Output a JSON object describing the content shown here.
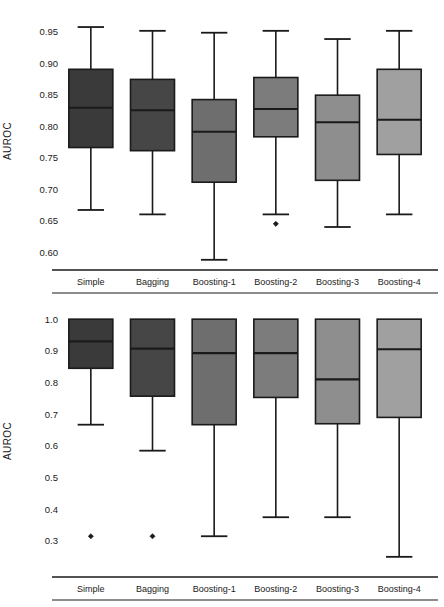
{
  "figure": {
    "ylabel": "AUROC",
    "categories": [
      "Simple",
      "Bagging",
      "Boosting-1",
      "Boosting-2",
      "Boosting-3",
      "Boosting-4"
    ],
    "box_colors": [
      "#3a3a3a",
      "#464646",
      "#6e6e6e",
      "#7c7c7c",
      "#8e8e8e",
      "#a0a0a0"
    ],
    "line_color": "#1a1a1a"
  },
  "chart_data": [
    {
      "type": "box",
      "panel": "top",
      "title": "",
      "xlabel": "",
      "ylabel": "AUROC",
      "categories": [
        "Simple",
        "Bagging",
        "Boosting-1",
        "Boosting-2",
        "Boosting-3",
        "Boosting-4"
      ],
      "ylim": [
        0.575,
        0.965
      ],
      "yticks": [
        0.6,
        0.65,
        0.7,
        0.75,
        0.8,
        0.85,
        0.9,
        0.95
      ],
      "ytick_labels": [
        "0.60",
        "0.65",
        "0.70",
        "0.75",
        "0.80",
        "0.85",
        "0.90",
        "0.95"
      ],
      "grid": false,
      "legend": "none",
      "boxes": [
        {
          "label": "Simple",
          "whisker_low": 0.667,
          "q1": 0.766,
          "median": 0.829,
          "q3": 0.89,
          "whisker_high": 0.957,
          "outliers": []
        },
        {
          "label": "Bagging",
          "whisker_low": 0.66,
          "q1": 0.761,
          "median": 0.825,
          "q3": 0.874,
          "whisker_high": 0.951,
          "outliers": []
        },
        {
          "label": "Boosting-1",
          "whisker_low": 0.588,
          "q1": 0.711,
          "median": 0.791,
          "q3": 0.842,
          "whisker_high": 0.948,
          "outliers": []
        },
        {
          "label": "Boosting-2",
          "whisker_low": 0.66,
          "q1": 0.783,
          "median": 0.827,
          "q3": 0.877,
          "whisker_high": 0.951,
          "outliers": [
            0.645
          ]
        },
        {
          "label": "Boosting-3",
          "whisker_low": 0.64,
          "q1": 0.714,
          "median": 0.806,
          "q3": 0.849,
          "whisker_high": 0.938,
          "outliers": []
        },
        {
          "label": "Boosting-4",
          "whisker_low": 0.66,
          "q1": 0.755,
          "median": 0.81,
          "q3": 0.89,
          "whisker_high": 0.951,
          "outliers": []
        }
      ]
    },
    {
      "type": "box",
      "panel": "bottom",
      "title": "",
      "xlabel": "",
      "ylabel": "AUROC",
      "categories": [
        "Simple",
        "Bagging",
        "Boosting-1",
        "Boosting-2",
        "Boosting-3",
        "Boosting-4"
      ],
      "ylim": [
        0.24,
        1.01
      ],
      "yticks": [
        0.3,
        0.4,
        0.5,
        0.6,
        0.7,
        0.8,
        0.9,
        1.0
      ],
      "ytick_labels": [
        "0.3",
        "0.4",
        "0.5",
        "0.6",
        "0.7",
        "0.8",
        "0.9",
        "1.0"
      ],
      "grid": false,
      "legend": "none",
      "boxes": [
        {
          "label": "Simple",
          "whisker_low": 0.667,
          "q1": 0.845,
          "median": 0.93,
          "q3": 1.0,
          "whisker_high": 1.0,
          "outliers": [
            0.315
          ]
        },
        {
          "label": "Bagging",
          "whisker_low": 0.585,
          "q1": 0.757,
          "median": 0.907,
          "q3": 1.0,
          "whisker_high": 1.0,
          "outliers": [
            0.315
          ]
        },
        {
          "label": "Boosting-1",
          "whisker_low": 0.315,
          "q1": 0.667,
          "median": 0.893,
          "q3": 1.0,
          "whisker_high": 1.0,
          "outliers": []
        },
        {
          "label": "Boosting-2",
          "whisker_low": 0.375,
          "q1": 0.753,
          "median": 0.893,
          "q3": 1.0,
          "whisker_high": 1.0,
          "outliers": []
        },
        {
          "label": "Boosting-3",
          "whisker_low": 0.375,
          "q1": 0.67,
          "median": 0.81,
          "q3": 1.0,
          "whisker_high": 1.0,
          "outliers": []
        },
        {
          "label": "Boosting-4",
          "whisker_low": 0.25,
          "q1": 0.69,
          "median": 0.905,
          "q3": 1.0,
          "whisker_high": 1.0,
          "outliers": []
        }
      ]
    }
  ]
}
